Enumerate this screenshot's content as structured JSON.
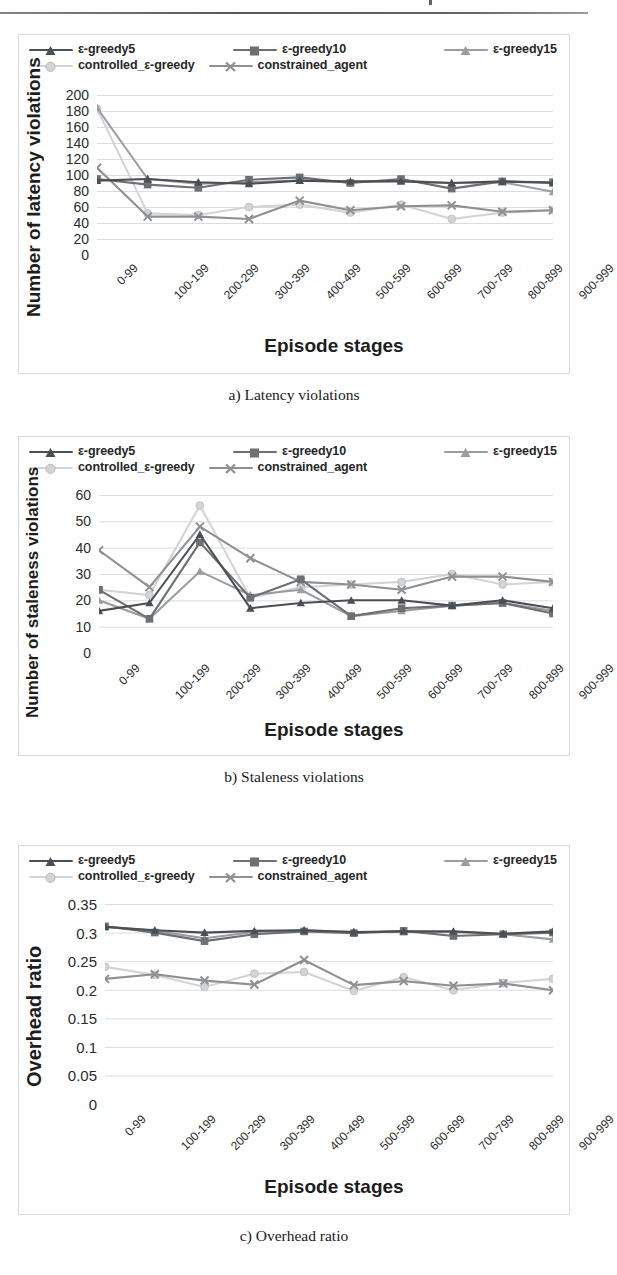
{
  "document": {
    "page_kind": "scanned-paper-figure",
    "series_names": [
      "ε-greedy5",
      "ε-greedy10",
      "ε-greedy15",
      "controlled_ε-greedy",
      "constrained_agent"
    ],
    "series_colors": [
      "#4a4f55",
      "#6d6f72",
      "#9a9da1",
      "#d2d4d6",
      "#8e9093"
    ],
    "series_markers": [
      "triangle",
      "square",
      "triangle",
      "circle",
      "x"
    ],
    "categories": [
      "0-99",
      "100-199",
      "200-299",
      "300-399",
      "400-499",
      "500-599",
      "600-699",
      "700-799",
      "800-899",
      "900-999"
    ],
    "xlabel": "Episode stages"
  },
  "figures": [
    {
      "id": "a",
      "caption": "a)  Latency violations",
      "chart_data": {
        "type": "line",
        "title": "",
        "xlabel": "Episode stages",
        "ylabel": "Number of latency violations",
        "categories": [
          "0-99",
          "100-199",
          "200-299",
          "300-399",
          "400-499",
          "500-599",
          "600-699",
          "700-799",
          "800-899",
          "900-999"
        ],
        "ylim": [
          0,
          200
        ],
        "yticks": [
          0,
          20,
          40,
          60,
          80,
          100,
          120,
          140,
          160,
          180,
          200
        ],
        "grid": true,
        "legend_position": "top",
        "series": [
          {
            "name": "ε-greedy5",
            "color": "#4a4f55",
            "marker": "triangle",
            "values": [
              93,
              95,
              91,
              89,
              93,
              92,
              92,
              90,
              92,
              90
            ]
          },
          {
            "name": "ε-greedy10",
            "color": "#6d6f72",
            "marker": "square",
            "values": [
              95,
              88,
              84,
              94,
              97,
              90,
              95,
              83,
              92,
              91
            ]
          },
          {
            "name": "ε-greedy15",
            "color": "#9a9da1",
            "marker": "triangle",
            "values": [
              184,
              95,
              89,
              91,
              93,
              91,
              93,
              90,
              91,
              79
            ]
          },
          {
            "name": "controlled_ε-greedy",
            "color": "#d2d4d6",
            "marker": "circle",
            "values": [
              183,
              52,
              50,
              60,
              63,
              53,
              63,
              45,
              53,
              56
            ]
          },
          {
            "name": "constrained_agent",
            "color": "#8e9093",
            "marker": "x",
            "values": [
              109,
              48,
              48,
              45,
              68,
              56,
              61,
              62,
              54,
              56
            ]
          }
        ]
      }
    },
    {
      "id": "b",
      "caption": "b)  Staleness violations",
      "chart_data": {
        "type": "line",
        "title": "",
        "xlabel": "Episode stages",
        "ylabel": "Number of staleness violations",
        "categories": [
          "0-99",
          "100-199",
          "200-299",
          "300-399",
          "400-499",
          "500-599",
          "600-699",
          "700-799",
          "800-899",
          "900-999"
        ],
        "ylim": [
          0,
          60
        ],
        "yticks": [
          0,
          10,
          20,
          30,
          40,
          50,
          60
        ],
        "grid": true,
        "legend_position": "top",
        "series": [
          {
            "name": "ε-greedy5",
            "color": "#4a4f55",
            "marker": "triangle",
            "values": [
              16,
              19,
              45,
              17,
              19,
              20,
              20,
              18,
              20,
              17
            ]
          },
          {
            "name": "ε-greedy10",
            "color": "#6d6f72",
            "marker": "square",
            "values": [
              24,
              13,
              42,
              21,
              28,
              14,
              17,
              18,
              19,
              15
            ]
          },
          {
            "name": "ε-greedy15",
            "color": "#9a9da1",
            "marker": "triangle",
            "values": [
              20,
              13,
              31,
              22,
              24,
              14,
              16,
              18,
              19,
              16
            ]
          },
          {
            "name": "controlled_ε-greedy",
            "color": "#d2d4d6",
            "marker": "circle",
            "values": [
              24,
              22,
              56,
              21,
              25,
              26,
              27,
              30,
              26,
              27
            ]
          },
          {
            "name": "constrained_agent",
            "color": "#8e9093",
            "marker": "x",
            "values": [
              39,
              25,
              48,
              36,
              27,
              26,
              24,
              29,
              29,
              27
            ]
          }
        ]
      }
    },
    {
      "id": "c",
      "caption": "c)  Overhead ratio",
      "chart_data": {
        "type": "line",
        "title": "",
        "xlabel": "Episode stages",
        "ylabel": "Overhead ratio",
        "categories": [
          "0-99",
          "100-199",
          "200-299",
          "300-399",
          "400-499",
          "500-599",
          "600-699",
          "700-799",
          "800-899",
          "900-999"
        ],
        "ylim": [
          0,
          0.35
        ],
        "yticks": [
          "0",
          "0.05",
          "0.1",
          "0.15",
          "0.2",
          "0.25",
          "0.3",
          "0.35"
        ],
        "ytick_values": [
          0,
          0.05,
          0.1,
          0.15,
          0.2,
          0.25,
          0.3,
          0.35
        ],
        "grid": true,
        "legend_position": "top",
        "series": [
          {
            "name": "ε-greedy5",
            "color": "#4a4f55",
            "marker": "triangle",
            "values": [
              0.31,
              0.304,
              0.3,
              0.303,
              0.304,
              0.301,
              0.302,
              0.302,
              0.298,
              0.302
            ]
          },
          {
            "name": "ε-greedy10",
            "color": "#6d6f72",
            "marker": "square",
            "values": [
              0.311,
              0.3,
              0.285,
              0.297,
              0.302,
              0.299,
              0.303,
              0.294,
              0.297,
              0.3
            ]
          },
          {
            "name": "ε-greedy15",
            "color": "#9a9da1",
            "marker": "triangle",
            "values": [
              0.31,
              0.303,
              0.29,
              0.301,
              0.304,
              0.301,
              0.301,
              0.301,
              0.297,
              0.288
            ]
          },
          {
            "name": "controlled_ε-greedy",
            "color": "#d2d4d6",
            "marker": "circle",
            "values": [
              0.24,
              0.226,
              0.205,
              0.228,
              0.231,
              0.198,
              0.222,
              0.199,
              0.212,
              0.219
            ]
          },
          {
            "name": "constrained_agent",
            "color": "#8e9093",
            "marker": "x",
            "values": [
              0.219,
              0.227,
              0.216,
              0.209,
              0.252,
              0.208,
              0.215,
              0.207,
              0.211,
              0.199
            ]
          }
        ]
      }
    }
  ]
}
